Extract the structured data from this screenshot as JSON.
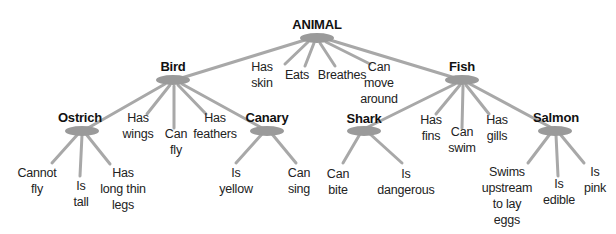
{
  "diagram": {
    "type": "semantic-network-hierarchy",
    "colors": {
      "node": "#9a9a9a",
      "edge": "#a8a8a8",
      "text": "#222222"
    },
    "nodes": {
      "animal": {
        "label": "ANIMAL",
        "properties": [
          "Has skin",
          "Eats",
          "Breathes",
          "Can move around"
        ]
      },
      "bird": {
        "label": "Bird",
        "properties": [
          "Has wings",
          "Can fly",
          "Has feathers"
        ]
      },
      "fish": {
        "label": "Fish",
        "properties": [
          "Has fins",
          "Can swim",
          "Has gills"
        ]
      },
      "ostrich": {
        "label": "Ostrich",
        "properties": [
          "Cannot fly",
          "Is tall",
          "Has long thin legs"
        ]
      },
      "canary": {
        "label": "Canary",
        "properties": [
          "Is yellow",
          "Can sing"
        ]
      },
      "shark": {
        "label": "Shark",
        "properties": [
          "Can bite",
          "Is dangerous"
        ]
      },
      "salmon": {
        "label": "Salmon",
        "properties": [
          "Swims upstream to lay eggs",
          "Is edible",
          "Is pink"
        ]
      }
    },
    "props": {
      "has_skin": [
        "Has",
        "skin"
      ],
      "eats": [
        "Eats"
      ],
      "breathes": [
        "Breathes"
      ],
      "can_move": [
        "Can",
        "move",
        "around"
      ],
      "has_wings": [
        "Has",
        "wings"
      ],
      "can_fly": [
        "Can",
        "fly"
      ],
      "has_feathers": [
        "Has",
        "feathers"
      ],
      "has_fins": [
        "Has",
        "fins"
      ],
      "can_swim": [
        "Can",
        "swim"
      ],
      "has_gills": [
        "Has",
        "gills"
      ],
      "cannot_fly": [
        "Cannot",
        "fly"
      ],
      "is_tall": [
        "Is",
        "tall"
      ],
      "long_legs": [
        "Has",
        "long thin",
        "legs"
      ],
      "is_yellow": [
        "Is",
        "yellow"
      ],
      "can_sing": [
        "Can",
        "sing"
      ],
      "can_bite": [
        "Can",
        "bite"
      ],
      "is_dangerous": [
        "Is",
        "dangerous"
      ],
      "swims_upstream": [
        "Swims",
        "upstream",
        "to lay",
        "eggs"
      ],
      "is_edible": [
        "Is",
        "edible"
      ],
      "is_pink": [
        "Is",
        "pink"
      ]
    }
  }
}
